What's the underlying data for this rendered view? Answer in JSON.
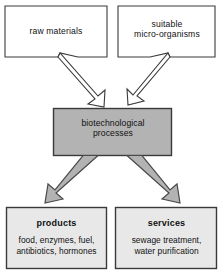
{
  "diagram": {
    "colors": {
      "process_fill": "#b3b3b3",
      "outcome_fill": "#e8e8e8",
      "input_fill": "#ffffff",
      "outline": "#3a3a3a",
      "gray_arrow_fill": "#b3b3b3",
      "white_arrow_fill": "#ffffff",
      "text": "#111111"
    },
    "inputs": [
      {
        "id": "raw-materials",
        "label": "raw materials",
        "shape": "box-with-arrow-tail"
      },
      {
        "id": "micro-organisms",
        "label": "suitable\nmicro-organisms",
        "shape": "box-with-arrow-tail"
      }
    ],
    "process": {
      "id": "biotechnological-processes",
      "label": "biotechnological\nprocesses",
      "shape": "filled-box"
    },
    "outcomes": [
      {
        "id": "products",
        "title": "products",
        "body": "food, enzymes, fuel,\nantibiotics, hormones"
      },
      {
        "id": "services",
        "title": "services",
        "body": "sewage treatment,\nwater purification"
      }
    ],
    "arrows": [
      {
        "id": "arrow-raw-materials-to-process",
        "from": "raw-materials",
        "to": "biotechnological-processes",
        "style": "outline",
        "direction": "down-right"
      },
      {
        "id": "arrow-micro-organisms-to-process",
        "from": "micro-organisms",
        "to": "biotechnological-processes",
        "style": "outline",
        "direction": "down-left"
      },
      {
        "id": "arrow-process-to-products",
        "from": "biotechnological-processes",
        "to": "products",
        "style": "filled-gray",
        "direction": "down-left"
      },
      {
        "id": "arrow-process-to-services",
        "from": "biotechnological-processes",
        "to": "services",
        "style": "filled-gray",
        "direction": "down-right"
      }
    ]
  }
}
